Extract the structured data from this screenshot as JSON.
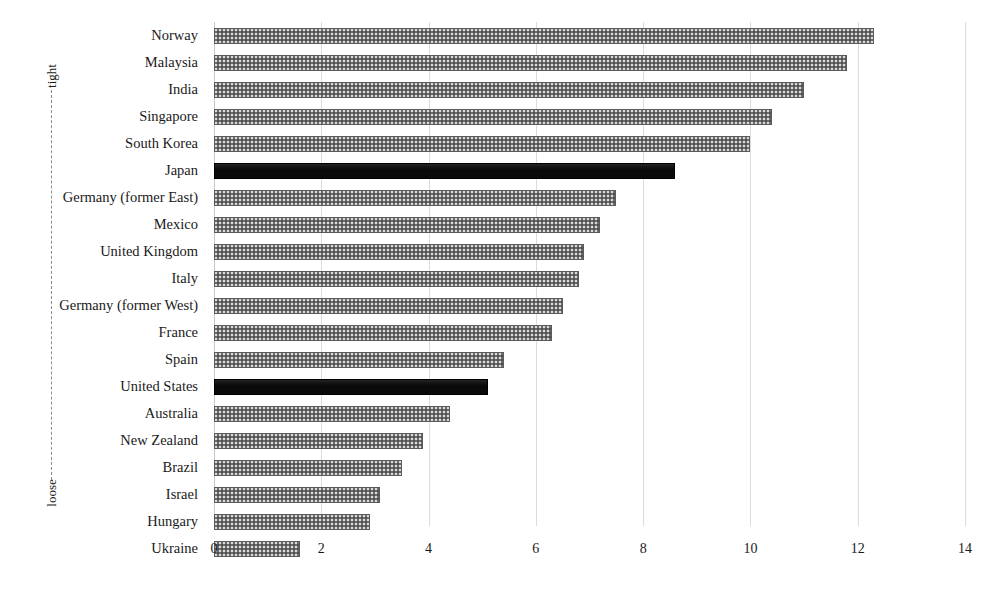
{
  "chart_data": {
    "type": "bar",
    "orientation": "horizontal",
    "title": "",
    "xlabel": "",
    "ylabel": "",
    "xlim": [
      0,
      14
    ],
    "xticks": [
      0,
      2,
      4,
      6,
      8,
      10,
      12,
      14
    ],
    "grid": true,
    "legend": null,
    "axis_annotations": {
      "top_label": "tight",
      "bottom_label": "loose"
    },
    "categories": [
      "Norway",
      "Malaysia",
      "India",
      "Singapore",
      "South Korea",
      "Japan",
      "Germany (former East)",
      "Mexico",
      "United Kingdom",
      "Italy",
      "Germany (former West)",
      "France",
      "Spain",
      "United States",
      "Australia",
      "New Zealand",
      "Brazil",
      "Israel",
      "Hungary",
      "Ukraine"
    ],
    "values": [
      12.3,
      11.8,
      11.0,
      10.4,
      10.0,
      8.6,
      7.5,
      7.2,
      6.9,
      6.8,
      6.5,
      6.3,
      5.4,
      5.1,
      4.4,
      3.9,
      3.5,
      3.1,
      2.9,
      1.6
    ],
    "highlighted": [
      "Japan",
      "United States"
    ],
    "colors": {
      "bar_default": "#6e6e6e",
      "bar_highlight": "#0a0a0a",
      "gridline": "#dcdcdc",
      "text": "#1a1a1a"
    }
  }
}
